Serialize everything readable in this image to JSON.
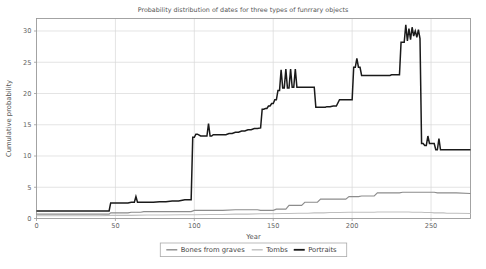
{
  "chart_data": {
    "type": "line",
    "title": "Probability distribution of dates for three types of funrrary objects",
    "xlabel": "Year",
    "ylabel": "Cumulative probability",
    "xlim": [
      0,
      275
    ],
    "ylim": [
      0,
      32
    ],
    "xticks": [
      0,
      50,
      100,
      150,
      200,
      250
    ],
    "yticks": [
      0,
      5,
      10,
      15,
      20,
      25,
      30
    ],
    "grid": true,
    "legend_position": "bottom-center",
    "legend": [
      "Bones from graves",
      "Tombs",
      "Portraits"
    ],
    "colors": {
      "bones_from_graves": "#8c8c8c",
      "tombs": "#bfbfbf",
      "portraits": "#1a1a1a",
      "grid": "#d9d9d9",
      "frame": "#9a9a9a",
      "text": "#555555",
      "background": "#ffffff"
    },
    "series": [
      {
        "name": "Bones from graves",
        "color_key": "bones_from_graves",
        "width": 1.1,
        "x": [
          0,
          20,
          46,
          47,
          58,
          60,
          66,
          68,
          80,
          95,
          98,
          100,
          102,
          112,
          118,
          126,
          128,
          140,
          142,
          150,
          152,
          158,
          160,
          168,
          170,
          178,
          180,
          182,
          190,
          196,
          198,
          204,
          206,
          214,
          216,
          222,
          224,
          230,
          232,
          238,
          240,
          244,
          246,
          252,
          254,
          258,
          260,
          266,
          275
        ],
        "y": [
          0.7,
          0.7,
          0.7,
          0.9,
          0.9,
          1.0,
          1.0,
          1.1,
          1.1,
          1.1,
          1.1,
          1.3,
          1.3,
          1.3,
          1.3,
          1.4,
          1.4,
          1.4,
          1.3,
          1.3,
          1.5,
          1.5,
          2.1,
          2.1,
          2.6,
          2.6,
          3.1,
          3.1,
          3.1,
          3.1,
          3.5,
          3.5,
          3.6,
          3.6,
          4.1,
          4.1,
          4.1,
          4.1,
          4.2,
          4.2,
          4.2,
          4.2,
          4.2,
          4.2,
          4.1,
          4.1,
          4.1,
          4.1,
          4.0
        ]
      },
      {
        "name": "Tombs",
        "color_key": "tombs",
        "width": 1.1,
        "x": [
          0,
          40,
          48,
          60,
          70,
          80,
          92,
          100,
          110,
          118,
          126,
          134,
          142,
          150,
          156,
          160,
          166,
          172,
          176,
          182,
          186,
          192,
          198,
          204,
          206,
          214,
          216,
          222,
          224,
          230,
          232,
          236,
          238,
          244,
          246,
          250,
          252,
          258,
          260,
          266,
          275
        ],
        "y": [
          0.45,
          0.45,
          0.5,
          0.5,
          0.55,
          0.55,
          0.6,
          0.6,
          0.65,
          0.65,
          0.7,
          0.7,
          0.75,
          0.75,
          0.8,
          0.8,
          0.85,
          0.85,
          0.9,
          0.9,
          0.95,
          0.95,
          1.0,
          1.0,
          1.0,
          1.0,
          1.05,
          1.05,
          1.05,
          1.05,
          1.05,
          1.05,
          1.0,
          1.0,
          0.95,
          0.95,
          0.9,
          0.9,
          0.85,
          0.85,
          0.8
        ]
      },
      {
        "name": "Portraits",
        "color_key": "portraits",
        "width": 1.5,
        "x": [
          0,
          10,
          20,
          30,
          40,
          44,
          46,
          47,
          52,
          56,
          58,
          60,
          62,
          63,
          64,
          65,
          66,
          70,
          74,
          78,
          82,
          86,
          90,
          94,
          96,
          97,
          98,
          99,
          100,
          101,
          102,
          104,
          106,
          108,
          109,
          110,
          111,
          112,
          113,
          114,
          116,
          118,
          120,
          122,
          124,
          126,
          128,
          130,
          132,
          134,
          136,
          138,
          140,
          142,
          143,
          144,
          145,
          146,
          147,
          148,
          149,
          150,
          151,
          152,
          153,
          154,
          155,
          156,
          157,
          158,
          159,
          160,
          161,
          162,
          163,
          164,
          165,
          166,
          167,
          168,
          169,
          170,
          171,
          172,
          173,
          174,
          175,
          176,
          177,
          178,
          179,
          180,
          181,
          182,
          183,
          184,
          185,
          186,
          188,
          190,
          192,
          194,
          196,
          198,
          200,
          201,
          202,
          203,
          204,
          205,
          206,
          208,
          210,
          212,
          214,
          216,
          218,
          220,
          221,
          222,
          223,
          224,
          225,
          226,
          227,
          228,
          229,
          230,
          231,
          232,
          233,
          234,
          235,
          236,
          237,
          238,
          239,
          240,
          241,
          242,
          243,
          244,
          245,
          246,
          247,
          248,
          249,
          250,
          251,
          252,
          253,
          254,
          255,
          256,
          258,
          260,
          262,
          264,
          266,
          268,
          270,
          275
        ],
        "y": [
          1.2,
          1.2,
          1.2,
          1.2,
          1.2,
          1.2,
          1.2,
          2.5,
          2.5,
          2.5,
          2.5,
          2.6,
          2.6,
          3.5,
          2.6,
          2.6,
          2.6,
          2.6,
          2.6,
          2.7,
          2.7,
          2.8,
          2.8,
          3.0,
          3.0,
          3.0,
          3.0,
          13.0,
          13.0,
          13.5,
          13.5,
          13.2,
          13.2,
          13.2,
          15.2,
          13.2,
          13.2,
          13.4,
          13.4,
          13.4,
          13.4,
          13.4,
          13.4,
          13.6,
          13.6,
          13.8,
          13.8,
          14.0,
          14.0,
          14.2,
          14.2,
          14.4,
          14.4,
          14.5,
          17.5,
          17.5,
          17.6,
          17.6,
          18.0,
          18.0,
          18.4,
          18.4,
          19.0,
          19.0,
          20.5,
          20.5,
          23.8,
          20.9,
          20.9,
          23.9,
          20.9,
          20.9,
          23.9,
          21.0,
          21.0,
          23.9,
          21.0,
          21.0,
          21.0,
          21.0,
          21.0,
          21.0,
          21.0,
          21.0,
          21.0,
          21.0,
          21.0,
          21.0,
          17.8,
          17.8,
          17.8,
          17.8,
          17.8,
          17.8,
          17.8,
          17.9,
          17.9,
          17.9,
          18.0,
          18.0,
          19.0,
          19.0,
          19.0,
          19.0,
          19.0,
          24.2,
          24.2,
          25.6,
          24.2,
          24.2,
          22.9,
          22.9,
          22.9,
          22.9,
          22.9,
          22.9,
          22.9,
          22.9,
          22.9,
          22.9,
          22.9,
          22.9,
          23.0,
          23.0,
          23.0,
          23.0,
          23.0,
          23.0,
          28.2,
          28.2,
          28.2,
          31.0,
          28.4,
          30.4,
          28.6,
          30.6,
          29.2,
          30.0,
          29.0,
          30.2,
          28.8,
          12.0,
          12.0,
          11.7,
          11.7,
          13.2,
          12.0,
          12.0,
          12.0,
          12.0,
          11.0,
          11.0,
          12.8,
          11.0,
          11.0,
          11.0,
          11.0,
          11.0,
          11.0,
          11.0,
          11.0,
          11.0
        ]
      }
    ]
  }
}
